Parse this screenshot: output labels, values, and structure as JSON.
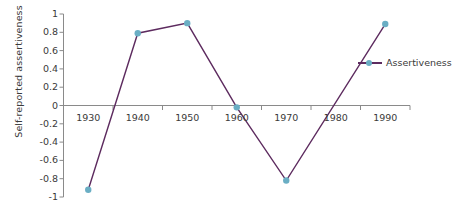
{
  "chart_data": {
    "type": "line",
    "title": "",
    "subtitle": "",
    "xlabel": "",
    "ylabel": "Self-reported assertiveness",
    "categories": [
      "1930",
      "1940",
      "1950",
      "1960",
      "1970",
      "1980",
      "1990"
    ],
    "x_tick_labels": [
      "1930",
      "1940",
      "1950",
      "1960",
      "1970",
      "1980",
      "1990"
    ],
    "y_tick_labels": [
      "1",
      "0.8",
      "0.6",
      "0.4",
      "0.2",
      "0",
      "-0.2",
      "-0.4",
      "-0.6",
      "-0.8",
      "-1"
    ],
    "y_tick_values": [
      1,
      0.8,
      0.6,
      0.4,
      0.2,
      0,
      -0.2,
      -0.4,
      -0.6,
      -0.8,
      -1
    ],
    "ylim": [
      -1,
      1
    ],
    "grid": false,
    "legend_position": "right",
    "series": [
      {
        "name": "Assertiveness",
        "line_color": "#5d2b5f",
        "marker_color": "#6aaec4",
        "values": [
          -0.92,
          0.79,
          0.9,
          -0.02,
          -0.82,
          null,
          0.89
        ],
        "points": [
          {
            "x": "1930",
            "y": -0.92,
            "marker": true
          },
          {
            "x": "1940",
            "y": 0.79,
            "marker": true
          },
          {
            "x": "1950",
            "y": 0.9,
            "marker": true
          },
          {
            "x": "1960",
            "y": -0.02,
            "marker": true
          },
          {
            "x": "1970",
            "y": -0.82,
            "marker": true
          },
          {
            "x": "1990",
            "y": 0.89,
            "marker": true
          }
        ]
      }
    ]
  },
  "legend": {
    "entries": [
      {
        "label": "Assertiveness"
      }
    ]
  },
  "colors": {
    "line": "#5d2b5f",
    "marker": "#6aaec4",
    "axis": "#8a8a8a",
    "zero_line": "#8a8a8a",
    "text": "#3a3a3a"
  }
}
